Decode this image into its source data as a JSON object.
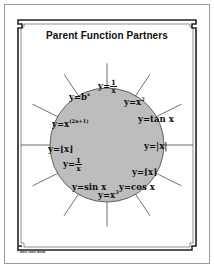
{
  "document": {
    "title": "Parent Function Partners",
    "footer": "© Mark Twain Media",
    "colors": {
      "circle_fill": "#bdbdbd",
      "frame": "#222222",
      "spoke": "#333333"
    },
    "functions": [
      {
        "id": "exponential",
        "text": "y=b",
        "sup": "x"
      },
      {
        "id": "reciprocal-top",
        "prefix": "y=",
        "num": "1",
        "den": "x"
      },
      {
        "id": "quadratic",
        "text": "y=x",
        "sup": "2"
      },
      {
        "id": "tangent",
        "text": "y=tan x"
      },
      {
        "id": "absolute-value",
        "text": "y=|x|"
      },
      {
        "id": "ceiling",
        "text": "y=⌈x⌉"
      },
      {
        "id": "cosine",
        "text": "y=cos x"
      },
      {
        "id": "cubic",
        "text": "y=x",
        "sup": "3"
      },
      {
        "id": "sine",
        "text": "y=sin x"
      },
      {
        "id": "reciprocal-bottom",
        "prefix": "y=",
        "num": "1",
        "den": "x"
      },
      {
        "id": "floor",
        "text": "y=⌊x⌋"
      },
      {
        "id": "odd-power",
        "text": "y=x",
        "sup": "(2n+1)"
      }
    ]
  }
}
